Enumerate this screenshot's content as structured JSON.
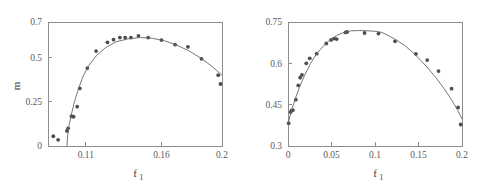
{
  "figure": {
    "background": "#ffffff",
    "marker_color": "#4d4d4d",
    "curve_color": "#666666",
    "axis_color": "#8c8c8c",
    "label_color": "#3d3d3d"
  },
  "chart_data": [
    {
      "panel": "left",
      "type": "scatter",
      "title": "",
      "xlabel": "f",
      "xlabel_sub": "1",
      "ylabel": "m",
      "ylabel_sub": "",
      "xlim": [
        0.085,
        0.2
      ],
      "ylim": [
        0,
        0.7
      ],
      "xticks": [
        0.11,
        0.16,
        0.2
      ],
      "xticklabels": [
        "0.11",
        "0.16",
        "0.2"
      ],
      "yticks": [
        0,
        0.25,
        0.5,
        0.7
      ],
      "yticklabels": [
        "0",
        "0.25",
        "0.5",
        "0.7"
      ],
      "grid": false,
      "legend": "none",
      "series": [
        {
          "name": "data",
          "kind": "scatter",
          "marker": "circle",
          "points": [
            [
              0.0885,
              0.055
            ],
            [
              0.0917,
              0.035
            ],
            [
              0.0975,
              0.085
            ],
            [
              0.0983,
              0.1
            ],
            [
              0.1005,
              0.168
            ],
            [
              0.1019,
              0.165
            ],
            [
              0.1043,
              0.222
            ],
            [
              0.106,
              0.325
            ],
            [
              0.111,
              0.44
            ],
            [
              0.1168,
              0.536
            ],
            [
              0.1243,
              0.585
            ],
            [
              0.1283,
              0.6
            ],
            [
              0.1325,
              0.612
            ],
            [
              0.136,
              0.612
            ],
            [
              0.1398,
              0.612
            ],
            [
              0.1448,
              0.622
            ],
            [
              0.1512,
              0.612
            ],
            [
              0.16,
              0.598
            ],
            [
              0.169,
              0.572
            ],
            [
              0.1775,
              0.56
            ],
            [
              0.1865,
              0.492
            ],
            [
              0.1975,
              0.4
            ],
            [
              0.199,
              0.35
            ]
          ]
        },
        {
          "name": "fit",
          "kind": "line",
          "points": [
            [
              0.0975,
              0.0
            ],
            [
              0.098,
              0.06
            ],
            [
              0.099,
              0.12
            ],
            [
              0.1005,
              0.18
            ],
            [
              0.1025,
              0.25
            ],
            [
              0.105,
              0.32
            ],
            [
              0.108,
              0.39
            ],
            [
              0.112,
              0.455
            ],
            [
              0.117,
              0.51
            ],
            [
              0.123,
              0.555
            ],
            [
              0.13,
              0.588
            ],
            [
              0.138,
              0.605
            ],
            [
              0.146,
              0.612
            ],
            [
              0.154,
              0.608
            ],
            [
              0.162,
              0.594
            ],
            [
              0.17,
              0.57
            ],
            [
              0.178,
              0.538
            ],
            [
              0.186,
              0.496
            ],
            [
              0.193,
              0.452
            ],
            [
              0.2,
              0.4
            ]
          ]
        }
      ]
    },
    {
      "panel": "right",
      "type": "scatter",
      "title": "",
      "xlabel": "f",
      "xlabel_sub": "1",
      "ylabel": "",
      "xlim": [
        0,
        0.2
      ],
      "ylim": [
        0.3,
        0.75
      ],
      "xticks": [
        0,
        0.05,
        0.1,
        0.15,
        0.2
      ],
      "xticklabels": [
        "0",
        "0.05",
        "0.1",
        "0.15",
        "0.2"
      ],
      "yticks": [
        0.3,
        0.45,
        0.6,
        0.75
      ],
      "yticklabels": [
        "0.3",
        "0.45",
        "0.6",
        "0.75"
      ],
      "grid": false,
      "legend": "none",
      "series": [
        {
          "name": "data",
          "kind": "scatter",
          "marker": "circle",
          "points": [
            [
              0.0008,
              0.383
            ],
            [
              0.003,
              0.423
            ],
            [
              0.004,
              0.428
            ],
            [
              0.0055,
              0.43
            ],
            [
              0.009,
              0.468
            ],
            [
              0.0118,
              0.52
            ],
            [
              0.014,
              0.548
            ],
            [
              0.016,
              0.558
            ],
            [
              0.021,
              0.6
            ],
            [
              0.025,
              0.618
            ],
            [
              0.033,
              0.635
            ],
            [
              0.044,
              0.672
            ],
            [
              0.0495,
              0.685
            ],
            [
              0.053,
              0.69
            ],
            [
              0.056,
              0.688
            ],
            [
              0.066,
              0.712
            ],
            [
              0.068,
              0.714
            ],
            [
              0.088,
              0.71
            ],
            [
              0.104,
              0.708
            ],
            [
              0.123,
              0.68
            ],
            [
              0.147,
              0.634
            ],
            [
              0.16,
              0.612
            ],
            [
              0.173,
              0.572
            ],
            [
              0.188,
              0.508
            ],
            [
              0.1955,
              0.44
            ],
            [
              0.1985,
              0.378
            ]
          ]
        },
        {
          "name": "fit",
          "kind": "line",
          "points": [
            [
              0.0,
              0.382
            ],
            [
              0.004,
              0.428
            ],
            [
              0.008,
              0.468
            ],
            [
              0.013,
              0.512
            ],
            [
              0.019,
              0.556
            ],
            [
              0.026,
              0.6
            ],
            [
              0.033,
              0.635
            ],
            [
              0.041,
              0.664
            ],
            [
              0.049,
              0.687
            ],
            [
              0.057,
              0.703
            ],
            [
              0.065,
              0.713
            ],
            [
              0.073,
              0.718
            ],
            [
              0.082,
              0.719
            ],
            [
              0.092,
              0.718
            ],
            [
              0.101,
              0.716
            ],
            [
              0.108,
              0.712
            ],
            [
              0.116,
              0.7
            ],
            [
              0.125,
              0.684
            ],
            [
              0.134,
              0.665
            ],
            [
              0.143,
              0.641
            ],
            [
              0.152,
              0.613
            ],
            [
              0.161,
              0.582
            ],
            [
              0.17,
              0.548
            ],
            [
              0.179,
              0.51
            ],
            [
              0.188,
              0.468
            ],
            [
              0.195,
              0.43
            ],
            [
              0.2,
              0.398
            ]
          ]
        }
      ]
    }
  ]
}
